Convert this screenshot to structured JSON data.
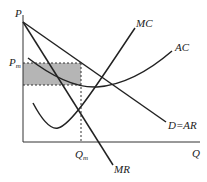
{
  "diagram": {
    "axes": {
      "y_label": "P",
      "x_label": "Q"
    },
    "price_label": {
      "main": "P",
      "sub": "m"
    },
    "quantity_label": {
      "main": "Q",
      "sub": "m"
    },
    "curves": {
      "mc": "MC",
      "ac": "AC",
      "demand": "D=AR",
      "mr": "MR"
    },
    "colors": {
      "line": "#222222",
      "profit_area": "#b0b0b0"
    }
  }
}
